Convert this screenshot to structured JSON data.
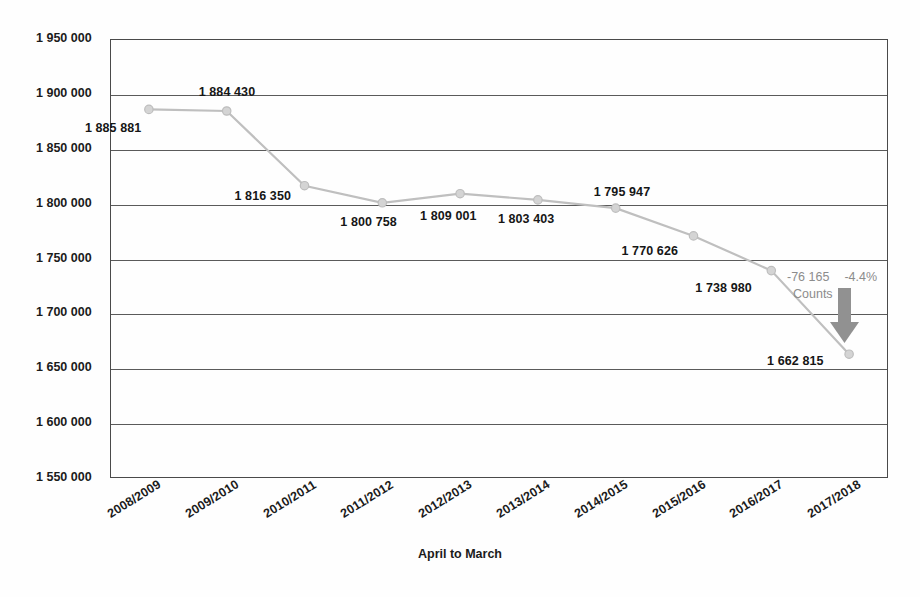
{
  "chart_data": {
    "type": "line",
    "title": "",
    "xlabel": "April to March",
    "ylabel": "",
    "categories": [
      "2008/2009",
      "2009/2010",
      "2010/2011",
      "2011/2012",
      "2012/2013",
      "2013/2014",
      "2014/2015",
      "2015/2016",
      "2016/2017",
      "2017/2018"
    ],
    "values": [
      1885881,
      1884430,
      1816350,
      1800758,
      1809001,
      1803403,
      1795947,
      1770626,
      1738980,
      1662815
    ],
    "data_labels": [
      "1 885 881",
      "1 884 430",
      "1 816 350",
      "1 800 758",
      "1 809 001",
      "1 803 403",
      "1 795 947",
      "1 770 626",
      "1 738 980",
      "1 662 815"
    ],
    "ylim": [
      1550000,
      1950000
    ],
    "ytick_values": [
      1950000,
      1900000,
      1850000,
      1800000,
      1750000,
      1700000,
      1650000,
      1600000,
      1550000
    ],
    "ytick_labels": [
      "1 950 000",
      "1 900 000",
      "1 850 000",
      "1 800 000",
      "1 750 000",
      "1 700 000",
      "1 650 000",
      "1 600 000",
      "1 550 000"
    ],
    "grid": true,
    "legend": "none",
    "series_color": "#bfbfbf",
    "marker_color": "#c9c9c9",
    "annotation": {
      "delta_value": "-76 165",
      "delta_percent": "-4.4%",
      "unit_label": "Counts",
      "arrow_direction": "down",
      "color": "#8c8c8c"
    }
  },
  "axis": {
    "x_title": "April to March"
  }
}
